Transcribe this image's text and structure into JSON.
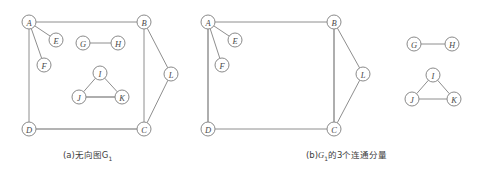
{
  "figure": {
    "title_a": "(a)无向图G",
    "title_a_sub": "1",
    "title_b_prefix": "(b)",
    "title_b_var": "G",
    "title_b_sub": "1",
    "title_b_suffix": "的3个连通分量",
    "colors": {
      "background": "#ffffff",
      "edge": "#8e8e8e",
      "node_stroke": "#8a8a8a",
      "node_fill": "#ffffff",
      "label": "#4a4a4a",
      "caption": "#3d3d3d"
    },
    "node_radius": 7
  },
  "chart_data": {
    "type": "diagram",
    "panels": [
      {
        "id": "a",
        "caption": "(a)无向图G1",
        "nodes": [
          {
            "id": "A",
            "label": "A",
            "x": 29,
            "y": 22
          },
          {
            "id": "B",
            "label": "B",
            "x": 144,
            "y": 22
          },
          {
            "id": "C",
            "label": "C",
            "x": 144,
            "y": 129
          },
          {
            "id": "D",
            "label": "D",
            "x": 29,
            "y": 129
          },
          {
            "id": "E",
            "label": "E",
            "x": 56,
            "y": 40
          },
          {
            "id": "F",
            "label": "F",
            "x": 44,
            "y": 65
          },
          {
            "id": "G",
            "label": "G",
            "x": 83,
            "y": 43
          },
          {
            "id": "H",
            "label": "H",
            "x": 118,
            "y": 43
          },
          {
            "id": "I",
            "label": "I",
            "x": 100,
            "y": 73
          },
          {
            "id": "J",
            "label": "J",
            "x": 79,
            "y": 97
          },
          {
            "id": "K",
            "label": "K",
            "x": 122,
            "y": 97
          },
          {
            "id": "L",
            "label": "L",
            "x": 171,
            "y": 74
          }
        ],
        "edges": [
          {
            "from": "A",
            "to": "B",
            "weight": "normal"
          },
          {
            "from": "A",
            "to": "D",
            "weight": "normal"
          },
          {
            "from": "A",
            "to": "E",
            "weight": "normal"
          },
          {
            "from": "A",
            "to": "F",
            "weight": "normal"
          },
          {
            "from": "B",
            "to": "C",
            "weight": "normal"
          },
          {
            "from": "B",
            "to": "L",
            "weight": "normal"
          },
          {
            "from": "C",
            "to": "L",
            "weight": "normal"
          },
          {
            "from": "C",
            "to": "D",
            "weight": "thick"
          },
          {
            "from": "G",
            "to": "H",
            "weight": "normal"
          },
          {
            "from": "I",
            "to": "J",
            "weight": "normal"
          },
          {
            "from": "I",
            "to": "K",
            "weight": "normal"
          },
          {
            "from": "J",
            "to": "K",
            "weight": "thick"
          }
        ]
      },
      {
        "id": "b",
        "caption": "(b)G1的3个连通分量",
        "nodes": [
          {
            "id": "A",
            "label": "A",
            "x": 208,
            "y": 22
          },
          {
            "id": "B",
            "label": "B",
            "x": 334,
            "y": 22
          },
          {
            "id": "C",
            "label": "C",
            "x": 334,
            "y": 129
          },
          {
            "id": "D",
            "label": "D",
            "x": 208,
            "y": 129
          },
          {
            "id": "E",
            "label": "E",
            "x": 235,
            "y": 40
          },
          {
            "id": "F",
            "label": "F",
            "x": 222,
            "y": 65
          },
          {
            "id": "L",
            "label": "L",
            "x": 363,
            "y": 74
          },
          {
            "id": "G",
            "label": "G",
            "x": 414,
            "y": 44
          },
          {
            "id": "H",
            "label": "H",
            "x": 452,
            "y": 44
          },
          {
            "id": "I",
            "label": "I",
            "x": 433,
            "y": 75
          },
          {
            "id": "J",
            "label": "J",
            "x": 412,
            "y": 99
          },
          {
            "id": "K",
            "label": "K",
            "x": 454,
            "y": 99
          }
        ],
        "edges": [
          {
            "from": "A",
            "to": "B",
            "weight": "normal"
          },
          {
            "from": "A",
            "to": "D",
            "weight": "thick"
          },
          {
            "from": "A",
            "to": "E",
            "weight": "normal"
          },
          {
            "from": "A",
            "to": "F",
            "weight": "normal"
          },
          {
            "from": "B",
            "to": "C",
            "weight": "thick"
          },
          {
            "from": "B",
            "to": "L",
            "weight": "normal"
          },
          {
            "from": "C",
            "to": "L",
            "weight": "normal"
          },
          {
            "from": "C",
            "to": "D",
            "weight": "normal"
          },
          {
            "from": "G",
            "to": "H",
            "weight": "normal"
          },
          {
            "from": "I",
            "to": "J",
            "weight": "normal"
          },
          {
            "from": "I",
            "to": "K",
            "weight": "normal"
          },
          {
            "from": "J",
            "to": "K",
            "weight": "normal"
          }
        ]
      }
    ]
  }
}
